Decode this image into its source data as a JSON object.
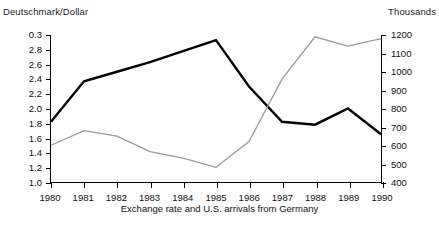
{
  "chart_data": {
    "type": "line",
    "title": "",
    "caption": "Exchange rate and U.S. arrivals from Germany",
    "xlabel": "",
    "x": [
      1980,
      1981,
      1982,
      1983,
      1984,
      1985,
      1986,
      1987,
      1988,
      1989,
      1990
    ],
    "xtick_labels": [
      "1980",
      "1981",
      "1982",
      "1983",
      "1984",
      "1985",
      "1986",
      "1987",
      "1988",
      "1989",
      "1990"
    ],
    "xlim": [
      1980,
      1990
    ],
    "grid": false,
    "legend": "none",
    "axes": [
      {
        "id": "left",
        "title": "Deutschmark/Dollar",
        "position": "left",
        "tick_labels": [
          "0.3",
          "2.8",
          "2.6",
          "2.4",
          "2.2",
          "2.0",
          "1.8",
          "1.6",
          "1.4",
          "1.2",
          "1.0"
        ],
        "tick_values": [
          3.0,
          2.8,
          2.6,
          2.4,
          2.2,
          2.0,
          1.8,
          1.6,
          1.4,
          1.2,
          1.0
        ],
        "ylim": [
          1.0,
          3.0
        ]
      },
      {
        "id": "right",
        "title": "Thousands",
        "position": "right",
        "tick_labels": [
          "1200",
          "1100",
          "1000",
          "900",
          "800",
          "700",
          "600",
          "500",
          "400"
        ],
        "tick_values": [
          1200,
          1100,
          1000,
          900,
          800,
          700,
          600,
          500,
          400
        ],
        "ylim": [
          400,
          1200
        ]
      }
    ],
    "series": [
      {
        "name": "Exchange rate (Deutschmark/Dollar)",
        "axis": "left",
        "color": "#000000",
        "width": 2.4,
        "values": [
          1.82,
          2.37,
          2.5,
          2.63,
          2.78,
          2.93,
          2.3,
          1.82,
          1.78,
          2.0,
          1.65
        ]
      },
      {
        "name": "U.S. arrivals from Germany (thousands)",
        "axis": "right",
        "color": "#9a9a9a",
        "width": 1.3,
        "values": [
          600,
          680,
          650,
          565,
          530,
          480,
          620,
          960,
          1190,
          1140,
          1180
        ]
      }
    ]
  }
}
